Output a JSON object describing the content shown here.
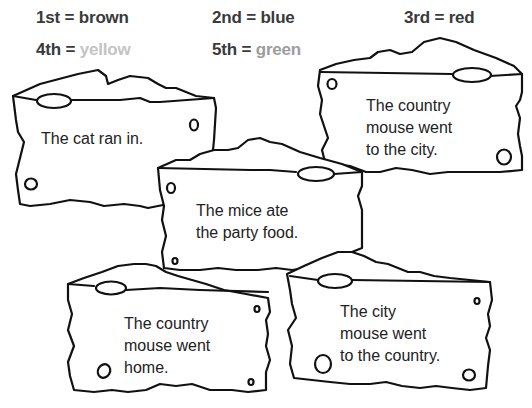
{
  "legend": [
    {
      "ordinal": "1st",
      "eq": "=",
      "color_name": "brown",
      "text_color": "#3a3a3a"
    },
    {
      "ordinal": "2nd",
      "eq": "=",
      "color_name": "blue",
      "text_color": "#3a3a3a"
    },
    {
      "ordinal": "3rd",
      "eq": "=",
      "color_name": "red",
      "text_color": "#3a3a3a"
    },
    {
      "ordinal": "4th",
      "eq": "=",
      "color_name": "yellow",
      "text_color": "#bdbdbd"
    },
    {
      "ordinal": "5th",
      "eq": "=",
      "color_name": "green",
      "text_color": "#9a9a9a"
    }
  ],
  "cheese_pieces": [
    {
      "text": "The cat ran in.",
      "order_color": ""
    },
    {
      "text": "The country\nmouse went\nto the city.",
      "order_color": ""
    },
    {
      "text": "The mice ate\nthe party food.",
      "order_color": ""
    },
    {
      "text": "The country\nmouse went\nhome.",
      "order_color": ""
    },
    {
      "text": "The city\nmouse went\nto the country.",
      "order_color": ""
    }
  ],
  "colors": {
    "outline": "#111111",
    "fill": "#ffffff",
    "text": "#222222"
  }
}
